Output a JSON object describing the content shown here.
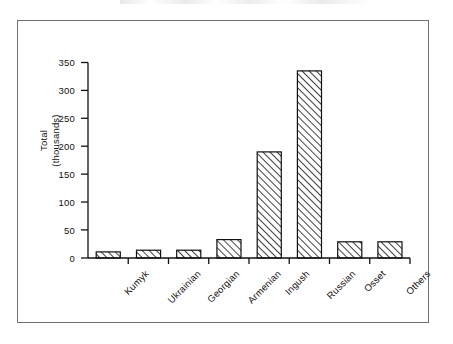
{
  "figure": {
    "background_color": "#ffffff",
    "frame_color": "#6f6f6f",
    "ink_color": "#111111"
  },
  "chart_data": {
    "type": "bar",
    "title": "",
    "subtitle": "",
    "xlabel": "",
    "ylabel": "Total\n(thousands)",
    "ylabel_line1": "Total",
    "ylabel_line2": "(thousands)",
    "categories": [
      "Kumyk",
      "Ukrainian",
      "Georgian",
      "Armenian",
      "Ingush",
      "Russian",
      "Osset",
      "Others"
    ],
    "values": [
      11,
      11,
      14,
      14,
      33,
      190,
      335,
      29
    ],
    "ylim": [
      0,
      350
    ],
    "yticks": [
      0,
      50,
      100,
      150,
      200,
      250,
      300,
      350
    ],
    "ytick_labels": [
      "0",
      "50",
      "100",
      "150",
      "200",
      "250",
      "300",
      "350"
    ],
    "grid": false,
    "legend": "none",
    "bar_fill": "hatch-diagonal-forward",
    "bar_edge_color": "#111111",
    "axis_color": "#111111"
  }
}
